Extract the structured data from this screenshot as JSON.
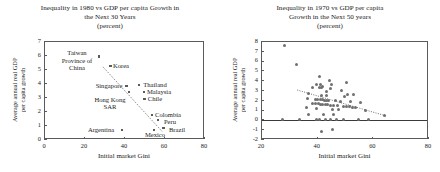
{
  "figure": {
    "axis_color": "#5a5a5a",
    "point_color": "#5b5b5b",
    "trend_color": "#6e6e6e"
  },
  "chart_data": [
    {
      "type": "scatter",
      "panel": "left",
      "title": "Inequality in 1980 vs GDP per capita Growth in the Next 30 Years (percent)",
      "title_lines": [
        "Inequality in 1980 vs GDP per capita Growth in",
        "the Next 30 Years",
        "(percent)"
      ],
      "xlabel": "Initial market Gini",
      "ylabel": "Average annual real GDP per capita growth",
      "ylabel_lines": [
        "Average annual real GDP",
        "per capita growth"
      ],
      "xlim": [
        0,
        80
      ],
      "ylim": [
        0,
        7
      ],
      "xticks": [
        0,
        20,
        40,
        60,
        80
      ],
      "yticks": [
        0,
        1,
        2,
        3,
        4,
        5,
        6,
        7
      ],
      "grid": false,
      "legend": "none",
      "points": [
        {
          "label": "Taiwan Province of China",
          "x": 27.6,
          "y": 5.9
        },
        {
          "label": "Korea",
          "x": 33.2,
          "y": 5.2
        },
        {
          "label": "Singapore",
          "x": 41.2,
          "y": 3.8
        },
        {
          "label": "Hong Kong SAR",
          "x": 42.6,
          "y": 3.35
        },
        {
          "label": "Thailand",
          "x": 47.4,
          "y": 3.85
        },
        {
          "label": "Malaysia",
          "x": 50.0,
          "y": 3.35
        },
        {
          "label": "Chile",
          "x": 50.2,
          "y": 2.85
        },
        {
          "label": "Colombia",
          "x": 54.0,
          "y": 1.72
        },
        {
          "label": "Peru",
          "x": 57.0,
          "y": 1.35
        },
        {
          "label": "Mexico",
          "x": 55.0,
          "y": 0.65
        },
        {
          "label": "Brazil",
          "x": 59.8,
          "y": 0.78
        },
        {
          "label": "Argentina",
          "x": 39.0,
          "y": 0.65
        }
      ],
      "annotations": [
        {
          "text": "Taiwan\nProvince of\nChina",
          "x": 16.5,
          "y": 5.6
        },
        {
          "text": "Korea",
          "x": 38.5,
          "y": 5.2
        },
        {
          "text": "Singapore",
          "x": 32.5,
          "y": 3.8
        },
        {
          "text": "Thailand",
          "x": 55.5,
          "y": 3.85
        },
        {
          "text": "Malaysia",
          "x": 57.5,
          "y": 3.35
        },
        {
          "text": "Chile",
          "x": 55.5,
          "y": 2.85
        },
        {
          "text": "Hong Kong\nSAR",
          "x": 33.0,
          "y": 2.55
        },
        {
          "text": "Colombia",
          "x": 62.0,
          "y": 1.72
        },
        {
          "text": "Peru",
          "x": 63.0,
          "y": 1.2
        },
        {
          "text": "Brazil",
          "x": 66.5,
          "y": 0.68
        },
        {
          "text": "Mexico",
          "x": 55.5,
          "y": 0.28
        },
        {
          "text": "Argentina",
          "x": 28.5,
          "y": 0.65
        }
      ],
      "trend": {
        "style": "dotted",
        "x0": 29.5,
        "y0": 5.15,
        "x1": 59.0,
        "y1": 0.55
      }
    },
    {
      "type": "scatter",
      "panel": "right",
      "title": "Inequality in 1970 vs GDP per capita Growth in the Next 50 years (percent)",
      "title_lines": [
        "Inequality in 1970 vs GDP per capita",
        "Growth in the Next 50 years",
        "(percent)"
      ],
      "xlabel": "Initial market Gini",
      "ylabel": "Average annual real GDP per capita growth",
      "ylabel_lines": [
        "Average annual real GDP",
        "per capita growth"
      ],
      "xlim": [
        20,
        80
      ],
      "ylim": [
        -2,
        8
      ],
      "xticks": [
        20,
        40,
        60,
        80
      ],
      "yticks": [
        -2,
        -1,
        0,
        1,
        2,
        3,
        4,
        5,
        6,
        7,
        8
      ],
      "grid": false,
      "legend": "none",
      "zero_line": 0,
      "points": [
        {
          "x": 28.4,
          "y": 7.5
        },
        {
          "x": 32.6,
          "y": 5.65
        },
        {
          "x": 41.0,
          "y": 4.35
        },
        {
          "x": 44.6,
          "y": 3.95
        },
        {
          "x": 50.7,
          "y": 3.8
        },
        {
          "x": 40.0,
          "y": 3.6
        },
        {
          "x": 41.5,
          "y": 3.55
        },
        {
          "x": 45.4,
          "y": 3.55
        },
        {
          "x": 42.0,
          "y": 3.35
        },
        {
          "x": 38.6,
          "y": 3.3
        },
        {
          "x": 41.0,
          "y": 3.25
        },
        {
          "x": 41.7,
          "y": 3.25
        },
        {
          "x": 45.0,
          "y": 3.2
        },
        {
          "x": 49.0,
          "y": 3.0
        },
        {
          "x": 43.6,
          "y": 2.8
        },
        {
          "x": 37.2,
          "y": 2.6
        },
        {
          "x": 51.0,
          "y": 2.55
        },
        {
          "x": 53.2,
          "y": 2.5
        },
        {
          "x": 41.8,
          "y": 2.45
        },
        {
          "x": 43.5,
          "y": 2.4
        },
        {
          "x": 50.0,
          "y": 2.3
        },
        {
          "x": 36.8,
          "y": 2.1
        },
        {
          "x": 39.5,
          "y": 2.05
        },
        {
          "x": 40.4,
          "y": 2.05
        },
        {
          "x": 41.2,
          "y": 2.0
        },
        {
          "x": 42.0,
          "y": 2.0
        },
        {
          "x": 42.8,
          "y": 1.95
        },
        {
          "x": 43.4,
          "y": 1.95
        },
        {
          "x": 44.2,
          "y": 1.9
        },
        {
          "x": 46.8,
          "y": 1.9
        },
        {
          "x": 48.6,
          "y": 1.85
        },
        {
          "x": 52.0,
          "y": 1.8
        },
        {
          "x": 55.8,
          "y": 1.7
        },
        {
          "x": 38.4,
          "y": 1.65
        },
        {
          "x": 39.6,
          "y": 1.6
        },
        {
          "x": 40.6,
          "y": 1.6
        },
        {
          "x": 41.4,
          "y": 1.55
        },
        {
          "x": 42.2,
          "y": 1.55
        },
        {
          "x": 43.0,
          "y": 1.5
        },
        {
          "x": 44.0,
          "y": 1.5
        },
        {
          "x": 45.0,
          "y": 1.45
        },
        {
          "x": 46.2,
          "y": 1.4
        },
        {
          "x": 47.5,
          "y": 1.4
        },
        {
          "x": 49.5,
          "y": 1.35
        },
        {
          "x": 50.6,
          "y": 1.3
        },
        {
          "x": 51.8,
          "y": 1.3
        },
        {
          "x": 53.0,
          "y": 1.25
        },
        {
          "x": 54.0,
          "y": 1.2
        },
        {
          "x": 36.4,
          "y": 1.2
        },
        {
          "x": 40.0,
          "y": 1.1
        },
        {
          "x": 45.6,
          "y": 1.05
        },
        {
          "x": 48.0,
          "y": 1.0
        },
        {
          "x": 57.5,
          "y": 0.95
        },
        {
          "x": 64.2,
          "y": 0.35
        },
        {
          "x": 37.0,
          "y": 0.55
        },
        {
          "x": 42.6,
          "y": 0.5
        },
        {
          "x": 46.0,
          "y": 0.45
        },
        {
          "x": 27.8,
          "y": 0.0
        },
        {
          "x": 34.0,
          "y": 0.0
        },
        {
          "x": 39.8,
          "y": 0.0
        },
        {
          "x": 41.0,
          "y": 0.0
        },
        {
          "x": 43.0,
          "y": 0.0
        },
        {
          "x": 44.8,
          "y": 0.0
        },
        {
          "x": 47.0,
          "y": 0.0
        },
        {
          "x": 49.8,
          "y": 0.0
        },
        {
          "x": 55.0,
          "y": 0.0
        },
        {
          "x": 58.6,
          "y": 0.0
        },
        {
          "x": 41.8,
          "y": -1.2
        },
        {
          "x": 45.8,
          "y": -1.05
        }
      ],
      "trend": {
        "style": "dotted",
        "x0": 33.0,
        "y0": 3.0,
        "x1": 65.0,
        "y1": 0.35
      }
    }
  ]
}
